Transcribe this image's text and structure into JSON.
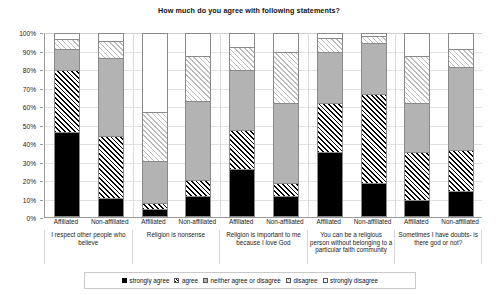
{
  "chart_data": {
    "type": "bar",
    "title": "How much do you agree with following statements?",
    "xlabel": "",
    "ylabel": "",
    "ylim": [
      0,
      100
    ],
    "stacked": true,
    "percent": true,
    "grid": true,
    "legend_position": "bottom",
    "ytick_labels": [
      "0%",
      "10%",
      "20%",
      "30%",
      "40%",
      "50%",
      "60%",
      "70%",
      "80%",
      "90%",
      "100%"
    ],
    "ytick_values": [
      0,
      10,
      20,
      30,
      40,
      50,
      60,
      70,
      80,
      90,
      100
    ],
    "groups": [
      "I respect other people who believe",
      "Religion is nonsense",
      "Religion is important to me because I love God",
      "You can be a religious person without belonging to a particular faith community",
      "Sometimes I have doubts- is there god or not?"
    ],
    "categories": [
      "Affiliated",
      "Non-affiliated",
      "Affiliated",
      "Non-affiliated",
      "Affiliated",
      "Non-affiliated",
      "Affiliated",
      "Non-affiliated",
      "Affiliated",
      "Non-affiliated"
    ],
    "series": [
      {
        "name": "strongly agree",
        "values": [
          46,
          10,
          4,
          11,
          26,
          11,
          35,
          18,
          9,
          14
        ]
      },
      {
        "name": "agree",
        "values": [
          34,
          34,
          3,
          9,
          21,
          7,
          27,
          49,
          26,
          22
        ]
      },
      {
        "name": "neither agree or disagree",
        "values": [
          12,
          43,
          23,
          43,
          33,
          44,
          28,
          28,
          27,
          46
        ]
      },
      {
        "name": "disagree",
        "values": [
          5,
          9,
          27,
          25,
          13,
          28,
          8,
          4,
          26,
          10
        ]
      },
      {
        "name": "strongly disagree",
        "values": [
          3,
          4,
          43,
          12,
          7,
          10,
          2,
          1,
          12,
          8
        ]
      }
    ]
  },
  "legend": {
    "items": [
      {
        "label": "strongly agree"
      },
      {
        "label": "agree"
      },
      {
        "label": "neither agree or disagree"
      },
      {
        "label": "disagree"
      },
      {
        "label": "strongly disagree"
      }
    ]
  }
}
